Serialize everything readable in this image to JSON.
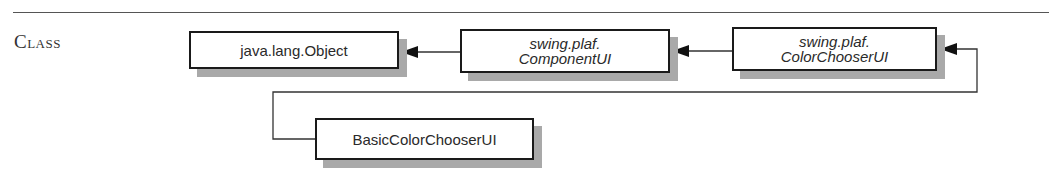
{
  "section": {
    "label": "Class"
  },
  "diagram": {
    "type": "class-hierarchy",
    "nodes": [
      {
        "id": "object",
        "lines": [
          "java.lang.Object"
        ],
        "abstract": false
      },
      {
        "id": "componentui",
        "lines": [
          "swing.plaf.",
          "ComponentUI"
        ],
        "abstract": true
      },
      {
        "id": "colorchooserui",
        "lines": [
          "swing.plaf.",
          "ColorChooserUI"
        ],
        "abstract": true
      },
      {
        "id": "basiccolorchooserui",
        "lines": [
          "BasicColorChooserUI"
        ],
        "abstract": false
      }
    ],
    "edges": [
      {
        "from": "componentui",
        "to": "object",
        "relation": "extends"
      },
      {
        "from": "colorchooserui",
        "to": "componentui",
        "relation": "extends"
      },
      {
        "from": "basiccolorchooserui",
        "to": "colorchooserui",
        "relation": "extends"
      }
    ],
    "colors": {
      "border": "#1a1a1a",
      "shadow": "#a9a9a9",
      "text": "#2a2a2a"
    }
  }
}
